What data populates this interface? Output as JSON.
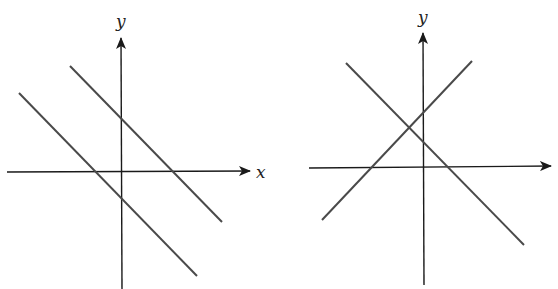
{
  "colors": {
    "axis": "#1a1a1a",
    "line": "#4a4a4a",
    "background": "#ffffff"
  },
  "panels": [
    {
      "name": "parallel-lines",
      "x_label": "x",
      "y_label": "y",
      "description": "Two parallel lines with negative slope"
    },
    {
      "name": "intersecting-lines",
      "x_label": "",
      "y_label": "y",
      "description": "Two perpendicular-looking lines intersecting above the x-axis, left of the y-axis"
    }
  ]
}
